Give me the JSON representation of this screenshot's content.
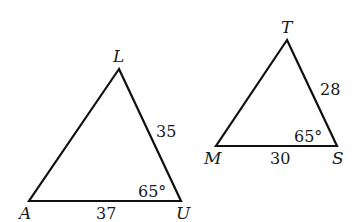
{
  "figure": {
    "stroke_color": "#111111",
    "background": "#ffffff"
  },
  "triangle_1": {
    "vertices": {
      "L": {
        "label": "L",
        "x": 119,
        "y": 69
      },
      "A": {
        "label": "A",
        "x": 29,
        "y": 201
      },
      "U": {
        "label": "U",
        "x": 181,
        "y": 201
      }
    },
    "side_LU": "35",
    "side_AU": "37",
    "angle_U": "65°"
  },
  "triangle_2": {
    "vertices": {
      "T": {
        "label": "T",
        "x": 287,
        "y": 40
      },
      "M": {
        "label": "M",
        "x": 216,
        "y": 146
      },
      "S": {
        "label": "S",
        "x": 337,
        "y": 146
      }
    },
    "side_TS": "28",
    "side_MS": "30",
    "angle_S": "65°"
  }
}
